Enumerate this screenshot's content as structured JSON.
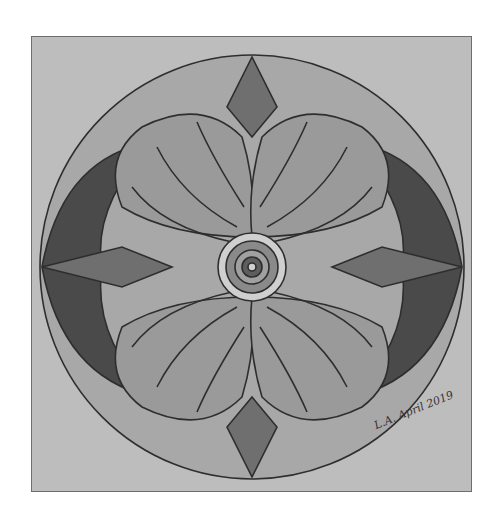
{
  "artwork": {
    "description": "Pencil-drawn mandala on gray paper: circle with four large petals, shaded outer lobes, concentric center",
    "signature": "L.A. April 2019",
    "colors": {
      "paper": "#bdbdbd",
      "outer_ring": "#a8a8a8",
      "diamond": "#6f6f6f",
      "petal": "#9a9a9a",
      "petal_band": "#858585",
      "dark_lobe": "#4a4a4a",
      "center_light": "#cfcfcf",
      "center_dark": "#5e5e5e",
      "line": "#2e2e2e"
    }
  }
}
